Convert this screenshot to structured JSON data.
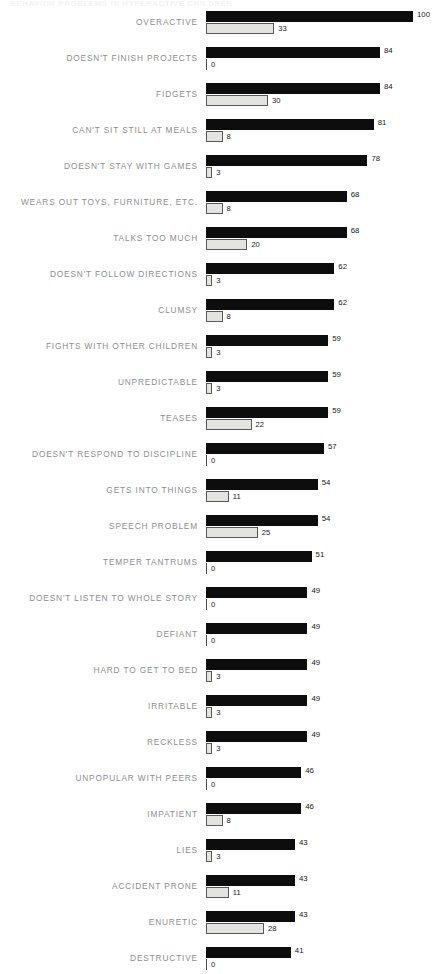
{
  "header": {
    "running_title": "BEHAVIOR PROBLEMS IN HYPERACTIVE CHILDREN"
  },
  "chart_data": {
    "type": "bar",
    "orientation": "horizontal",
    "title": "",
    "xlabel": "",
    "ylabel": "",
    "xlim": [
      0,
      100
    ],
    "grid": false,
    "legend_position": "none",
    "series": [
      {
        "name": "primary",
        "style": "dark-filled",
        "values": [
          100,
          84,
          84,
          81,
          78,
          68,
          68,
          62,
          62,
          59,
          59,
          59,
          57,
          54,
          54,
          51,
          49,
          49,
          49,
          49,
          49,
          46,
          46,
          43,
          43,
          43,
          41
        ]
      },
      {
        "name": "secondary",
        "style": "light-outlined",
        "values": [
          33,
          0,
          30,
          8,
          3,
          8,
          20,
          3,
          8,
          3,
          3,
          22,
          0,
          11,
          25,
          0,
          0,
          0,
          3,
          3,
          3,
          0,
          8,
          3,
          11,
          28,
          0
        ]
      }
    ],
    "categories": [
      "OVERACTIVE",
      "DOESN'T FINISH PROJECTS",
      "FIDGETS",
      "CAN'T SIT STILL AT MEALS",
      "DOESN'T STAY WITH GAMES",
      "WEARS OUT TOYS, FURNITURE, ETC.",
      "TALKS TOO MUCH",
      "DOESN'T FOLLOW DIRECTIONS",
      "CLUMSY",
      "FIGHTS WITH OTHER CHILDREN",
      "UNPREDICTABLE",
      "TEASES",
      "DOESN'T RESPOND TO DISCIPLINE",
      "GETS INTO THINGS",
      "SPEECH PROBLEM",
      "TEMPER TANTRUMS",
      "DOESN'T LISTEN TO WHOLE STORY",
      "DEFIANT",
      "HARD TO GET TO BED",
      "IRRITABLE",
      "RECKLESS",
      "UNPOPULAR WITH PEERS",
      "IMPATIENT",
      "LIES",
      "ACCIDENT PRONE",
      "ENURETIC",
      "DESTRUCTIVE"
    ],
    "rows": [
      {
        "label": "OVERACTIVE",
        "primary": 100,
        "secondary": 33
      },
      {
        "label": "DOESN'T FINISH PROJECTS",
        "primary": 84,
        "secondary": 0
      },
      {
        "label": "FIDGETS",
        "primary": 84,
        "secondary": 30
      },
      {
        "label": "CAN'T SIT STILL AT MEALS",
        "primary": 81,
        "secondary": 8
      },
      {
        "label": "DOESN'T STAY WITH GAMES",
        "primary": 78,
        "secondary": 3
      },
      {
        "label": "WEARS OUT TOYS, FURNITURE, ETC.",
        "primary": 68,
        "secondary": 8
      },
      {
        "label": "TALKS TOO MUCH",
        "primary": 68,
        "secondary": 20
      },
      {
        "label": "DOESN'T FOLLOW DIRECTIONS",
        "primary": 62,
        "secondary": 3
      },
      {
        "label": "CLUMSY",
        "primary": 62,
        "secondary": 8
      },
      {
        "label": "FIGHTS WITH OTHER CHILDREN",
        "primary": 59,
        "secondary": 3
      },
      {
        "label": "UNPREDICTABLE",
        "primary": 59,
        "secondary": 3
      },
      {
        "label": "TEASES",
        "primary": 59,
        "secondary": 22
      },
      {
        "label": "DOESN'T RESPOND TO DISCIPLINE",
        "primary": 57,
        "secondary": 0
      },
      {
        "label": "GETS INTO THINGS",
        "primary": 54,
        "secondary": 11
      },
      {
        "label": "SPEECH PROBLEM",
        "primary": 54,
        "secondary": 25
      },
      {
        "label": "TEMPER TANTRUMS",
        "primary": 51,
        "secondary": 0
      },
      {
        "label": "DOESN'T LISTEN TO WHOLE STORY",
        "primary": 49,
        "secondary": 0
      },
      {
        "label": "DEFIANT",
        "primary": 49,
        "secondary": 0
      },
      {
        "label": "HARD TO GET TO BED",
        "primary": 49,
        "secondary": 3
      },
      {
        "label": "IRRITABLE",
        "primary": 49,
        "secondary": 3
      },
      {
        "label": "RECKLESS",
        "primary": 49,
        "secondary": 3
      },
      {
        "label": "UNPOPULAR WITH PEERS",
        "primary": 46,
        "secondary": 0
      },
      {
        "label": "IMPATIENT",
        "primary": 46,
        "secondary": 8
      },
      {
        "label": "LIES",
        "primary": 43,
        "secondary": 3
      },
      {
        "label": "ACCIDENT PRONE",
        "primary": 43,
        "secondary": 11
      },
      {
        "label": "ENURETIC",
        "primary": 43,
        "secondary": 28
      },
      {
        "label": "DESTRUCTIVE",
        "primary": 41,
        "secondary": 0
      }
    ]
  },
  "colors": {
    "primary_bar": "#0d0d0d",
    "secondary_bar_fill": "#e3e3e1",
    "secondary_bar_stroke": "#58585a",
    "label_text": "#8d8d90",
    "value_text": "#17171a",
    "background": "#ffffff"
  }
}
